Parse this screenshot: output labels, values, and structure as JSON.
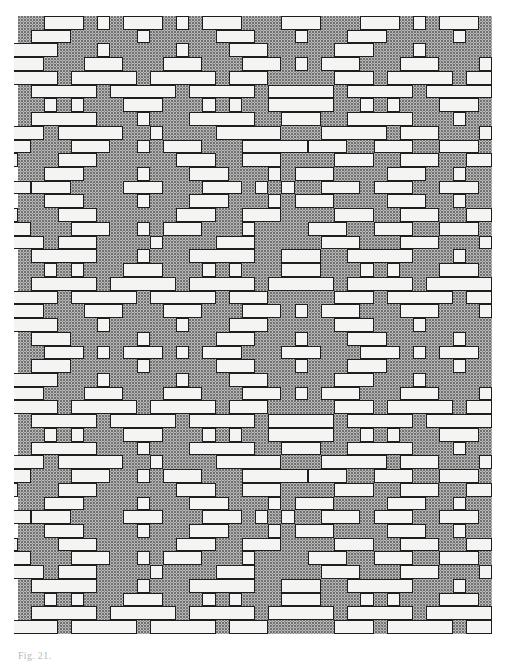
{
  "figure": {
    "caption": "Fig. 21.",
    "grid": {
      "origin_x": 18,
      "origin_y": 16,
      "col_w": 13.17,
      "row_h": 13.73,
      "cols": 36,
      "rows": 45
    },
    "colors": {
      "background": "#ffffff",
      "ground_stipple": "#b9b9b9",
      "float_fill": "#f4f4f2",
      "outline": "#1e1e1e"
    },
    "rows": [
      [
        [
          2,
          3
        ],
        [
          6,
          1
        ],
        [
          8,
          3
        ],
        [
          12,
          1
        ],
        [
          14,
          3
        ],
        [
          20,
          3
        ],
        [
          26,
          3
        ],
        [
          30,
          1
        ],
        [
          32,
          3
        ]
      ],
      [
        [
          1,
          3
        ],
        [
          9,
          1
        ],
        [
          15,
          3
        ],
        [
          21,
          1
        ],
        [
          25,
          3
        ],
        [
          33,
          1
        ]
      ],
      [
        [
          -1,
          4
        ],
        [
          6,
          1
        ],
        [
          12,
          1
        ],
        [
          16,
          3
        ],
        [
          24,
          3
        ],
        [
          30,
          1
        ]
      ],
      [
        [
          -1,
          3
        ],
        [
          5,
          3
        ],
        [
          11,
          3
        ],
        [
          17,
          3
        ],
        [
          21,
          1
        ],
        [
          23,
          3
        ],
        [
          29,
          3
        ],
        [
          35,
          1
        ]
      ],
      [
        [
          -1,
          4
        ],
        [
          4,
          5
        ],
        [
          10,
          5
        ],
        [
          16,
          3
        ],
        [
          24,
          3
        ],
        [
          28,
          5
        ],
        [
          34,
          2
        ]
      ],
      [
        [
          1,
          5
        ],
        [
          7,
          5
        ],
        [
          13,
          5
        ],
        [
          19,
          5
        ],
        [
          25,
          5
        ],
        [
          31,
          5
        ]
      ],
      [
        [
          2,
          1
        ],
        [
          4,
          1
        ],
        [
          8,
          3
        ],
        [
          14,
          1
        ],
        [
          16,
          1
        ],
        [
          19,
          5
        ],
        [
          26,
          1
        ],
        [
          28,
          1
        ],
        [
          32,
          3
        ]
      ],
      [
        [
          1,
          5
        ],
        [
          9,
          1
        ],
        [
          13,
          5
        ],
        [
          20,
          3
        ],
        [
          25,
          5
        ],
        [
          33,
          1
        ]
      ],
      [
        [
          -1,
          3
        ],
        [
          3,
          5
        ],
        [
          10,
          1
        ],
        [
          15,
          5
        ],
        [
          23,
          5
        ],
        [
          29,
          3
        ],
        [
          35,
          1
        ]
      ],
      [
        [
          -1,
          2
        ],
        [
          4,
          3
        ],
        [
          9,
          1
        ],
        [
          11,
          3
        ],
        [
          17,
          5
        ],
        [
          22,
          3
        ],
        [
          27,
          3
        ],
        [
          32,
          3
        ]
      ],
      [
        [
          -1,
          1
        ],
        [
          3,
          3
        ],
        [
          12,
          3
        ],
        [
          17,
          3
        ],
        [
          24,
          3
        ],
        [
          29,
          3
        ],
        [
          34,
          2
        ]
      ],
      [
        [
          2,
          3
        ],
        [
          9,
          1
        ],
        [
          13,
          3
        ],
        [
          19,
          1
        ],
        [
          21,
          3
        ],
        [
          28,
          3
        ],
        [
          33,
          1
        ]
      ],
      [
        [
          -1,
          2
        ],
        [
          1,
          3
        ],
        [
          8,
          3
        ],
        [
          14,
          3
        ],
        [
          18,
          1
        ],
        [
          20,
          1
        ],
        [
          23,
          3
        ],
        [
          27,
          3
        ],
        [
          32,
          3
        ]
      ],
      [
        [
          2,
          3
        ],
        [
          9,
          1
        ],
        [
          13,
          3
        ],
        [
          19,
          1
        ],
        [
          21,
          3
        ],
        [
          28,
          3
        ],
        [
          33,
          1
        ]
      ],
      [
        [
          -1,
          1
        ],
        [
          3,
          3
        ],
        [
          12,
          3
        ],
        [
          17,
          3
        ],
        [
          24,
          3
        ],
        [
          29,
          3
        ],
        [
          34,
          2
        ]
      ],
      [
        [
          -1,
          2
        ],
        [
          4,
          3
        ],
        [
          9,
          1
        ],
        [
          11,
          3
        ],
        [
          17,
          1
        ],
        [
          22,
          3
        ],
        [
          27,
          3
        ],
        [
          32,
          3
        ]
      ],
      [
        [
          -1,
          3
        ],
        [
          3,
          3
        ],
        [
          10,
          1
        ],
        [
          15,
          3
        ],
        [
          23,
          3
        ],
        [
          29,
          3
        ],
        [
          35,
          1
        ]
      ],
      [
        [
          1,
          5
        ],
        [
          9,
          1
        ],
        [
          13,
          5
        ],
        [
          20,
          3
        ],
        [
          25,
          5
        ],
        [
          33,
          1
        ]
      ],
      [
        [
          2,
          1
        ],
        [
          4,
          1
        ],
        [
          8,
          3
        ],
        [
          14,
          1
        ],
        [
          16,
          1
        ],
        [
          20,
          3
        ],
        [
          26,
          1
        ],
        [
          28,
          1
        ],
        [
          32,
          3
        ]
      ],
      [
        [
          1,
          5
        ],
        [
          7,
          5
        ],
        [
          13,
          5
        ],
        [
          19,
          5
        ],
        [
          25,
          5
        ],
        [
          31,
          5
        ]
      ],
      [
        [
          -1,
          4
        ],
        [
          4,
          5
        ],
        [
          10,
          5
        ],
        [
          16,
          3
        ],
        [
          24,
          3
        ],
        [
          28,
          5
        ],
        [
          34,
          2
        ]
      ],
      [
        [
          -1,
          3
        ],
        [
          5,
          3
        ],
        [
          11,
          3
        ],
        [
          17,
          3
        ],
        [
          21,
          1
        ],
        [
          23,
          3
        ],
        [
          29,
          3
        ],
        [
          35,
          1
        ]
      ],
      [
        [
          -1,
          4
        ],
        [
          6,
          1
        ],
        [
          12,
          1
        ],
        [
          16,
          3
        ],
        [
          24,
          3
        ],
        [
          30,
          1
        ]
      ],
      [
        [
          1,
          3
        ],
        [
          9,
          1
        ],
        [
          15,
          3
        ],
        [
          21,
          1
        ],
        [
          25,
          3
        ],
        [
          33,
          1
        ]
      ],
      [
        [
          2,
          3
        ],
        [
          6,
          1
        ],
        [
          8,
          3
        ],
        [
          12,
          1
        ],
        [
          14,
          3
        ],
        [
          20,
          3
        ],
        [
          26,
          3
        ],
        [
          30,
          1
        ],
        [
          32,
          3
        ]
      ],
      [
        [
          1,
          3
        ],
        [
          9,
          1
        ],
        [
          15,
          3
        ],
        [
          21,
          1
        ],
        [
          25,
          3
        ],
        [
          33,
          1
        ]
      ],
      [
        [
          -1,
          4
        ],
        [
          6,
          1
        ],
        [
          12,
          1
        ],
        [
          16,
          3
        ],
        [
          24,
          3
        ],
        [
          30,
          1
        ]
      ],
      [
        [
          -1,
          3
        ],
        [
          5,
          3
        ],
        [
          11,
          3
        ],
        [
          17,
          3
        ],
        [
          21,
          1
        ],
        [
          23,
          3
        ],
        [
          29,
          3
        ],
        [
          35,
          1
        ]
      ],
      [
        [
          -1,
          4
        ],
        [
          4,
          5
        ],
        [
          10,
          5
        ],
        [
          16,
          3
        ],
        [
          24,
          3
        ],
        [
          28,
          5
        ],
        [
          34,
          2
        ]
      ],
      [
        [
          1,
          5
        ],
        [
          7,
          5
        ],
        [
          13,
          5
        ],
        [
          19,
          5
        ],
        [
          25,
          5
        ],
        [
          31,
          5
        ]
      ],
      [
        [
          2,
          1
        ],
        [
          4,
          1
        ],
        [
          8,
          3
        ],
        [
          14,
          1
        ],
        [
          16,
          1
        ],
        [
          19,
          5
        ],
        [
          26,
          1
        ],
        [
          28,
          1
        ],
        [
          32,
          3
        ]
      ],
      [
        [
          1,
          5
        ],
        [
          9,
          1
        ],
        [
          13,
          5
        ],
        [
          20,
          3
        ],
        [
          25,
          5
        ],
        [
          33,
          1
        ]
      ],
      [
        [
          -1,
          3
        ],
        [
          3,
          5
        ],
        [
          10,
          1
        ],
        [
          15,
          5
        ],
        [
          23,
          5
        ],
        [
          29,
          3
        ],
        [
          35,
          1
        ]
      ],
      [
        [
          -1,
          2
        ],
        [
          4,
          3
        ],
        [
          9,
          1
        ],
        [
          11,
          3
        ],
        [
          17,
          5
        ],
        [
          22,
          3
        ],
        [
          27,
          3
        ],
        [
          32,
          3
        ]
      ],
      [
        [
          -1,
          1
        ],
        [
          3,
          3
        ],
        [
          12,
          3
        ],
        [
          17,
          3
        ],
        [
          24,
          3
        ],
        [
          29,
          3
        ],
        [
          34,
          2
        ]
      ],
      [
        [
          2,
          3
        ],
        [
          9,
          1
        ],
        [
          13,
          3
        ],
        [
          19,
          1
        ],
        [
          21,
          3
        ],
        [
          28,
          3
        ],
        [
          33,
          1
        ]
      ],
      [
        [
          -1,
          2
        ],
        [
          1,
          3
        ],
        [
          8,
          3
        ],
        [
          14,
          3
        ],
        [
          18,
          1
        ],
        [
          20,
          1
        ],
        [
          23,
          3
        ],
        [
          27,
          3
        ],
        [
          32,
          3
        ]
      ],
      [
        [
          2,
          3
        ],
        [
          9,
          1
        ],
        [
          13,
          3
        ],
        [
          19,
          1
        ],
        [
          21,
          3
        ],
        [
          28,
          3
        ],
        [
          33,
          1
        ]
      ],
      [
        [
          -1,
          1
        ],
        [
          3,
          3
        ],
        [
          12,
          3
        ],
        [
          17,
          3
        ],
        [
          24,
          3
        ],
        [
          29,
          3
        ],
        [
          34,
          2
        ]
      ],
      [
        [
          -1,
          2
        ],
        [
          4,
          3
        ],
        [
          9,
          1
        ],
        [
          11,
          3
        ],
        [
          17,
          1
        ],
        [
          22,
          3
        ],
        [
          27,
          3
        ],
        [
          32,
          3
        ]
      ],
      [
        [
          -1,
          3
        ],
        [
          3,
          3
        ],
        [
          10,
          1
        ],
        [
          15,
          3
        ],
        [
          23,
          3
        ],
        [
          29,
          3
        ],
        [
          35,
          1
        ]
      ],
      [
        [
          1,
          5
        ],
        [
          9,
          1
        ],
        [
          13,
          5
        ],
        [
          20,
          3
        ],
        [
          25,
          5
        ],
        [
          33,
          1
        ]
      ],
      [
        [
          2,
          1
        ],
        [
          4,
          1
        ],
        [
          8,
          3
        ],
        [
          14,
          1
        ],
        [
          16,
          1
        ],
        [
          20,
          3
        ],
        [
          26,
          1
        ],
        [
          28,
          1
        ],
        [
          32,
          3
        ]
      ],
      [
        [
          1,
          5
        ],
        [
          7,
          5
        ],
        [
          13,
          5
        ],
        [
          19,
          5
        ],
        [
          25,
          5
        ],
        [
          31,
          5
        ]
      ],
      [
        [
          -1,
          4
        ],
        [
          4,
          5
        ],
        [
          10,
          5
        ],
        [
          16,
          3
        ],
        [
          24,
          3
        ],
        [
          28,
          5
        ],
        [
          34,
          2
        ]
      ]
    ]
  }
}
